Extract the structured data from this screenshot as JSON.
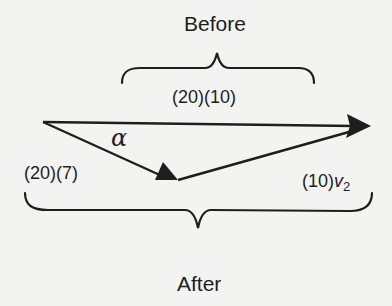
{
  "diagram": {
    "title_before": "Before",
    "title_after": "After",
    "colors": {
      "ink": "#1e1e1e",
      "background": "#f3f3f1"
    },
    "vectors": {
      "before_momentum": {
        "label": "(20)(10)",
        "description": "initial momentum vector, horizontal"
      },
      "after_momentum_1": {
        "label": "(20)(7)",
        "description": "momentum of first object after, directed down-right"
      },
      "after_momentum_2": {
        "label_prefix": "(10)",
        "label_var": "v",
        "label_sub": "2",
        "description": "momentum of second object after, completing triangle"
      }
    },
    "angle": {
      "symbol": "α"
    }
  }
}
